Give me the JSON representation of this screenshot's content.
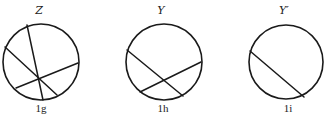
{
  "figures": [
    {
      "title": "Z",
      "caption": "1g",
      "circle": {
        "cx": 41,
        "cy": 62,
        "r": 38
      },
      "chords": [
        {
          "x1": 27,
          "y1": 25,
          "x2": 43,
          "y2": 100
        },
        {
          "x1": 5,
          "y1": 47,
          "x2": 57,
          "y2": 95
        },
        {
          "x1": 16,
          "y1": 88,
          "x2": 78,
          "y2": 63
        }
      ],
      "title_pos": {
        "x": 39,
        "y": 14
      },
      "caption_pos": {
        "x": 41,
        "y": 112
      }
    },
    {
      "title": "Y",
      "caption": "1h",
      "circle": {
        "cx": 164,
        "cy": 62,
        "r": 38
      },
      "chords": [
        {
          "x1": 127,
          "y1": 50,
          "x2": 183,
          "y2": 96
        },
        {
          "x1": 140,
          "y1": 92,
          "x2": 201,
          "y2": 62
        }
      ],
      "title_pos": {
        "x": 161,
        "y": 14
      },
      "caption_pos": {
        "x": 163,
        "y": 112
      }
    },
    {
      "title": "Y′",
      "caption": "1i",
      "circle": {
        "cx": 286,
        "cy": 62,
        "r": 37
      },
      "chords": [
        {
          "x1": 250,
          "y1": 51,
          "x2": 304,
          "y2": 97
        }
      ],
      "title_pos": {
        "x": 284,
        "y": 14
      },
      "caption_pos": {
        "x": 288,
        "y": 112
      }
    }
  ],
  "colors": {
    "stroke": "#1a1a1a",
    "background": "#ffffff"
  }
}
